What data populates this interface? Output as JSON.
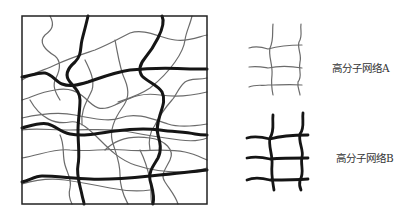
{
  "diagram": {
    "type": "interpenetrating polymer network illustration",
    "main_panel": {
      "description": "Square box showing two interpenetrating polymer networks: thin gray wavy chains (network A) and thick black wavy chains (network B)",
      "frame_color": "#222222"
    },
    "legend": [
      {
        "label": "高分子网络A",
        "style": "thin gray grid",
        "color": "#666666",
        "stroke_width": 1.2
      },
      {
        "label": "高分子网络B",
        "style": "thick black grid",
        "color": "#111111",
        "stroke_width": 3
      }
    ]
  }
}
